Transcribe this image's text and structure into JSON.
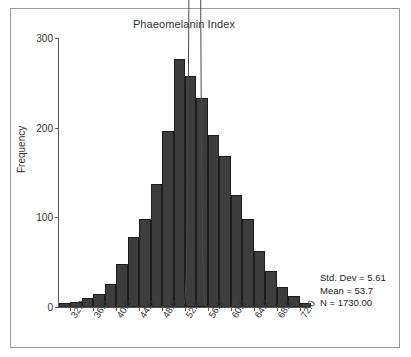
{
  "chart_data": {
    "type": "bar",
    "title": "Phaeomelanin Index",
    "xlabel": "",
    "ylabel": "Frequency",
    "ylim": [
      0,
      300
    ],
    "yticks": [
      0,
      100,
      200,
      300
    ],
    "ytick_labels": [
      "0",
      "100",
      "200",
      "300"
    ],
    "xlim": [
      30,
      74
    ],
    "xticks": [
      32.0,
      36.0,
      40.0,
      44.0,
      48.0,
      52.0,
      56.0,
      60.0,
      64.0,
      68.0,
      72.0
    ],
    "xtick_labels": [
      "32.0",
      "36.0",
      "40.0",
      "44.0",
      "48.0",
      "52.0",
      "56.0",
      "60.0",
      "64.0",
      "68.0",
      "72.0"
    ],
    "bin_width": 2.0,
    "grid": false,
    "legend": false,
    "bar_color": "#3d3d3d",
    "bar_edge_color": "#1d1d1d",
    "curve_color": "#4a4a4a",
    "overlay": "normal-distribution-curve",
    "categories": [
      "30-32",
      "32-34",
      "34-36",
      "36-38",
      "38-40",
      "40-42",
      "42-44",
      "44-46",
      "46-48",
      "48-50",
      "50-52",
      "52-54",
      "54-56",
      "56-58",
      "58-60",
      "60-62",
      "62-64",
      "64-66",
      "66-68",
      "68-70",
      "70-72",
      "72-74"
    ],
    "bin_centers": [
      31,
      33,
      35,
      37,
      39,
      41,
      43,
      45,
      47,
      49,
      51,
      53,
      55,
      57,
      59,
      61,
      63,
      65,
      67,
      69,
      71,
      73
    ],
    "values": [
      4,
      6,
      10,
      14,
      26,
      48,
      78,
      98,
      137,
      196,
      277,
      258,
      233,
      192,
      168,
      125,
      98,
      62,
      40,
      22,
      12,
      5
    ],
    "annotations": {
      "std_dev": "Std. Dev = 5.61",
      "mean": "Mean = 53.7",
      "n": "N = 1730.00"
    }
  },
  "stats": {
    "std_dev": "Std. Dev = 5.61",
    "mean": "Mean = 53.7",
    "n": "N = 1730.00"
  }
}
